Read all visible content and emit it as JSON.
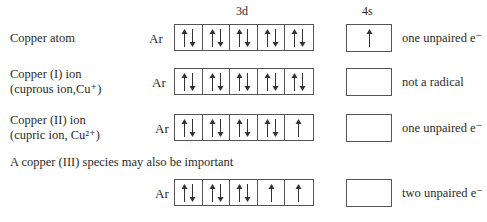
{
  "headers": {
    "d": "3d",
    "s": "4s"
  },
  "core": "Ar",
  "rows": [
    {
      "label_lines": [
        "Copper atom"
      ],
      "d": [
        "ud",
        "ud",
        "ud",
        "ud",
        "ud"
      ],
      "s": "u",
      "note": "one unpaired e⁻"
    },
    {
      "label_lines": [
        "Copper (I) ion",
        "(cuprous ion,Cu⁺)"
      ],
      "d": [
        "ud",
        "ud",
        "ud",
        "ud",
        "ud"
      ],
      "s": "",
      "note": "not a radical"
    },
    {
      "label_lines": [
        "Copper (II) ion",
        "(cupric ion, Cu²⁺)"
      ],
      "d": [
        "ud",
        "ud",
        "ud",
        "ud",
        "u"
      ],
      "s": "",
      "note": "one unpaired e⁻"
    },
    {
      "label_lines": [],
      "d": [
        "ud",
        "ud",
        "ud",
        "u",
        "u"
      ],
      "s": "",
      "note": "two unpaired e⁻"
    }
  ],
  "section_note": "A copper (III) species may also be important"
}
